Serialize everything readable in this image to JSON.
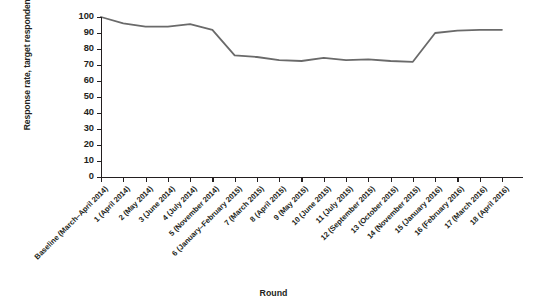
{
  "chart_data": {
    "type": "line",
    "title": "",
    "xlabel": "Round",
    "ylabel": "Response rate, target respondents, %",
    "ylim": [
      0,
      100
    ],
    "yticks": [
      0,
      10,
      20,
      30,
      40,
      50,
      60,
      70,
      80,
      90,
      100
    ],
    "grid": false,
    "legend": "none",
    "line_color": "#6a6a6a",
    "categories": [
      "Baseline (March–April 2014)",
      "1 (April 2014)",
      "2 (May 2014)",
      "3 (June 2014)",
      "4 (July 2014)",
      "5 (November 2014)",
      "6 (January–February 2015)",
      "7 (March 2015)",
      "8 (April 2015)",
      "9 (May 2015)",
      "10 (June 2015)",
      "11 (July 2015)",
      "12 (September 2015)",
      "13 (October 2015)",
      "14 (November 2015)",
      "15 (January 2016)",
      "16 (February 2016)",
      "17 (March 2016)",
      "18 (April 2016)"
    ],
    "values": [
      100,
      96,
      94,
      94,
      95.5,
      92,
      76,
      75,
      73,
      72.5,
      74.5,
      73,
      73.5,
      72.5,
      72,
      90,
      91.5,
      92,
      92
    ]
  }
}
